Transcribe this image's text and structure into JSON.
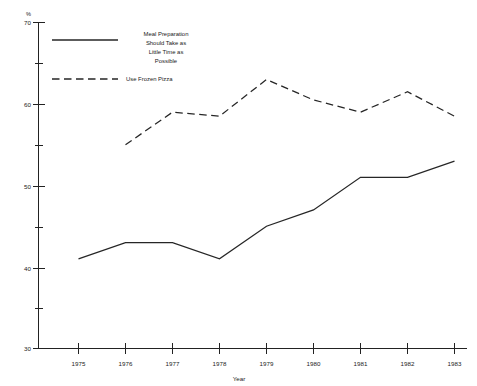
{
  "chart_data": {
    "type": "line",
    "title": "",
    "xlabel": "Year",
    "ylabel": "%",
    "x": [
      1975,
      1976,
      1977,
      1978,
      1979,
      1980,
      1981,
      1982,
      1983
    ],
    "categories": [
      "1975",
      "1976",
      "1977",
      "1978",
      "1979",
      "1980",
      "1981",
      "1982",
      "1983"
    ],
    "xlim": [
      1974.4,
      1983.4
    ],
    "ylim": [
      30,
      70
    ],
    "y_ticks_major": [
      30,
      40,
      50,
      60,
      70
    ],
    "y_ticks_minor": [
      35,
      45,
      55,
      65
    ],
    "y_tick_labels": [
      "30",
      "40",
      "50",
      "60",
      "70"
    ],
    "grid": false,
    "legend_position": "upper-left-inside",
    "series": [
      {
        "name": "Meal Preparation Should Take as Little Time as Possible",
        "style": "solid",
        "x": [
          1975,
          1976,
          1977,
          1978,
          1979,
          1980,
          1981,
          1982,
          1983
        ],
        "values": [
          41,
          43,
          43,
          41,
          45,
          47,
          51,
          51,
          53
        ]
      },
      {
        "name": "Use Frozen Pizza",
        "style": "dashed",
        "x": [
          1976,
          1977,
          1978,
          1979,
          1980,
          1981,
          1982,
          1983
        ],
        "values": [
          55,
          59,
          58.5,
          63,
          60.5,
          59,
          61.5,
          58.5
        ]
      }
    ]
  },
  "axes": {
    "y_unit_label": "%",
    "x_axis_title": "Year"
  },
  "legend": {
    "entries": [
      {
        "id": "meal-prep",
        "style": "solid",
        "lines": [
          "Meal Preparation",
          "Should Take as",
          "Little Time as",
          "Possible"
        ]
      },
      {
        "id": "frozen-pizza",
        "style": "dashed",
        "lines": [
          "Use Frozen Pizza"
        ]
      }
    ]
  },
  "colors": {
    "line": "#262626",
    "axis": "#222222",
    "text": "#1a1a1a",
    "background": "#ffffff"
  }
}
